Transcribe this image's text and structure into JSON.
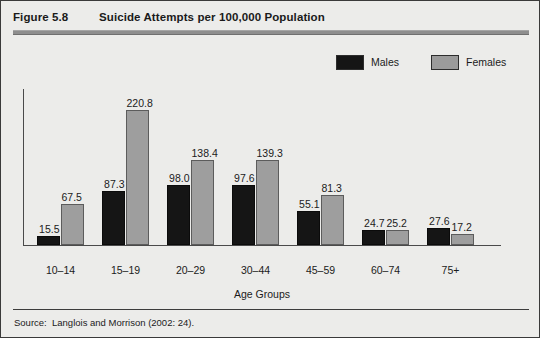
{
  "figure": {
    "number": "Figure 5.8",
    "title": "Suicide Attempts per 100,000 Population",
    "source": "Source:  Langlois and Morrison (2002: 24)."
  },
  "legend": {
    "males_label": "Males",
    "females_label": "Females",
    "males_color": "#151515",
    "females_color": "#9e9e9e",
    "position": "top-right"
  },
  "chart_data": {
    "type": "bar",
    "title": "Suicide Attempts per 100,000 Population",
    "xlabel": "Age Groups",
    "ylabel": "",
    "grid": false,
    "ylim": [
      0,
      230
    ],
    "categories": [
      "10–14",
      "15–19",
      "20–29",
      "30–44",
      "45–59",
      "60–74",
      "75+"
    ],
    "series": [
      {
        "name": "Males",
        "color": "#151515",
        "values": [
          15.5,
          87.3,
          98.0,
          97.6,
          55.1,
          24.7,
          27.6
        ],
        "labels": [
          "15.5",
          "87.3",
          "98.0",
          "97.6",
          "55.1",
          "24.7",
          "27.6"
        ]
      },
      {
        "name": "Females",
        "color": "#9e9e9e",
        "values": [
          67.5,
          220.8,
          138.4,
          139.3,
          81.3,
          25.2,
          17.2
        ],
        "labels": [
          "67.5",
          "220.8",
          "138.4",
          "139.3",
          "81.3",
          "25.2",
          "17.2"
        ]
      }
    ]
  }
}
